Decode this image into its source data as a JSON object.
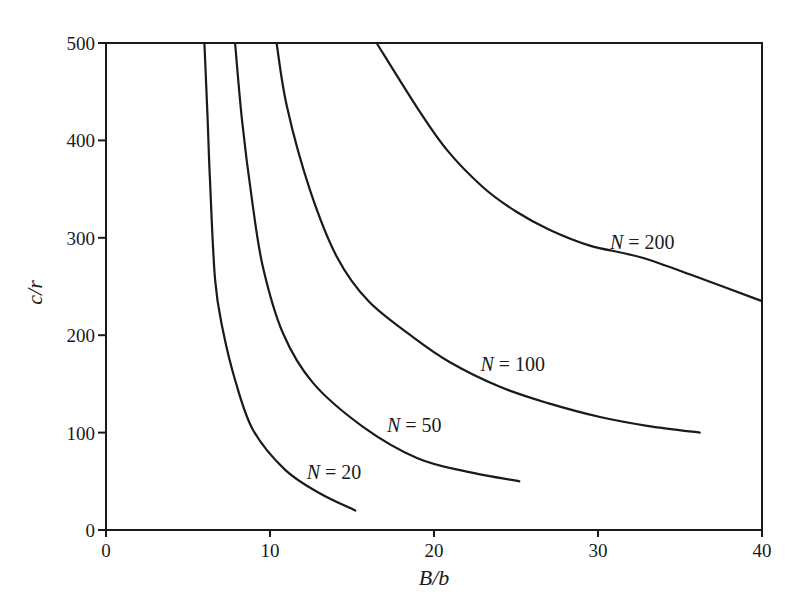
{
  "chart_data": {
    "type": "line",
    "title": "",
    "xlabel": "B/b",
    "ylabel": "c/r",
    "xlim": [
      0,
      40
    ],
    "ylim": [
      0,
      500
    ],
    "xticks": [
      0,
      10,
      20,
      30,
      40
    ],
    "yticks": [
      0,
      100,
      200,
      300,
      400,
      500
    ],
    "xtick_labels": [
      "0",
      "10",
      "20",
      "30",
      "40"
    ],
    "ytick_labels": [
      "0",
      "100",
      "200",
      "300",
      "400",
      "500"
    ],
    "grid": false,
    "legend": "none (curves labeled inline)",
    "series": [
      {
        "name": "N = 20",
        "label": {
          "var": "N",
          "rest": " = 20",
          "x": 13.9,
          "y": 60
        },
        "x": [
          6.0,
          6.2,
          6.34,
          6.65,
          7.13,
          7.87,
          8.96,
          10.91,
          13.0,
          15.2
        ],
        "y": [
          500,
          420,
          359,
          257,
          205,
          154,
          103,
          62,
          38,
          20
        ]
      },
      {
        "name": "N = 50",
        "label": {
          "var": "N",
          "rest": " = 50",
          "x": 18.8,
          "y": 108
        },
        "x": [
          7.87,
          8.3,
          8.9,
          9.57,
          10.79,
          12.62,
          15.67,
          18.96,
          22.0,
          25.2
        ],
        "y": [
          500,
          420,
          339,
          270,
          202,
          151,
          106,
          74,
          60,
          50
        ]
      },
      {
        "name": "N = 100",
        "label": {
          "var": "N",
          "rest": " = 100",
          "x": 24.8,
          "y": 170
        },
        "x": [
          10.4,
          11.04,
          12.44,
          14.09,
          16.0,
          18.72,
          21.0,
          24.02,
          27.0,
          30.12,
          33.0,
          36.2
        ],
        "y": [
          500,
          434,
          349,
          280,
          235,
          198,
          172,
          147,
          130,
          116,
          107,
          100
        ]
      },
      {
        "name": "N = 200",
        "label": {
          "var": "N",
          "rest": " = 200",
          "x": 32.7,
          "y": 296
        },
        "x": [
          16.5,
          18.96,
          20.8,
          22.99,
          25.0,
          27.07,
          29.5,
          32.6,
          36.0,
          40.0
        ],
        "y": [
          500,
          434,
          390,
          352,
          327,
          308,
          292,
          280,
          260,
          235
        ]
      }
    ]
  },
  "colors": {
    "line": "#1a1a1a",
    "background": "#ffffff"
  },
  "layout": {
    "plot_left": 106,
    "plot_right": 762,
    "plot_top": 43,
    "plot_bottom": 530
  }
}
